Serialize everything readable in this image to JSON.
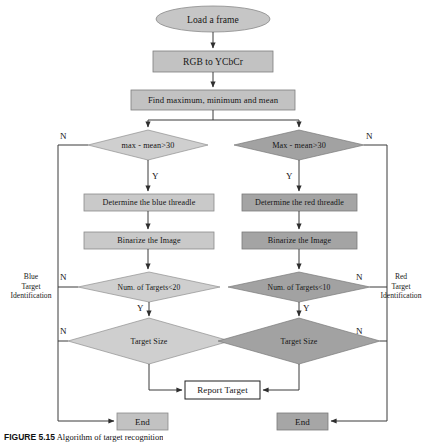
{
  "diagram": {
    "colors": {
      "blue_branch_fill": "#c9c9c9",
      "red_branch_fill": "#a6a6a6",
      "common_fill": "#bfbfbf",
      "white_fill": "#ffffff",
      "stroke": "#6b6b6b",
      "dark_stroke": "#2b2b2b",
      "text": "#141414"
    },
    "nodes": {
      "start": {
        "label": "Load a frame",
        "shape": "ellipse"
      },
      "convert": {
        "label": "RGB to YCbCr",
        "shape": "process"
      },
      "stats": {
        "label": "Find maximum, minimum and mean",
        "shape": "process"
      },
      "blue_decision": {
        "label": "max - mean>30",
        "shape": "decision"
      },
      "red_decision": {
        "label": "Max - mean>30",
        "shape": "decision"
      },
      "blue_threshold": {
        "label": "Determine the blue threadle",
        "shape": "process"
      },
      "red_threshold": {
        "label": "Determine the red threadle",
        "shape": "process"
      },
      "blue_binarize": {
        "label": "Binarize the Image",
        "shape": "process"
      },
      "red_binarize": {
        "label": "Binarize the Image",
        "shape": "process"
      },
      "blue_count": {
        "label": "Num. of Targets<20",
        "shape": "decision"
      },
      "red_count": {
        "label": "Num. of Targets<10",
        "shape": "decision"
      },
      "blue_size": {
        "label": "Target Size",
        "shape": "decision"
      },
      "red_size": {
        "label": "Target Size",
        "shape": "decision"
      },
      "report": {
        "label": "Report Target",
        "shape": "process-white"
      },
      "blue_end": {
        "label": "End",
        "shape": "process"
      },
      "red_end": {
        "label": "End",
        "shape": "process"
      }
    },
    "branch_labels": {
      "blue": "Blue\nTarget\nIdentification",
      "red": "Red\nTarget\nIdentification"
    },
    "edge_labels": {
      "yes": "Y",
      "no": "N"
    },
    "caption": {
      "figure_number": "FIGURE 5.15",
      "rest": "  Algorithm of target recognition"
    }
  }
}
